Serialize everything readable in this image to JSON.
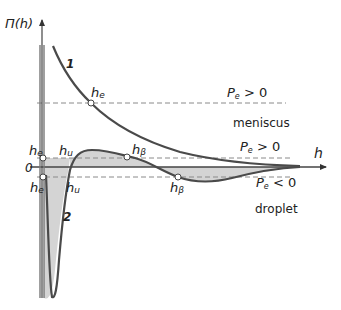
{
  "diagram": {
    "y_axis_label": "Π(h)",
    "x_axis_label": "h",
    "zero_label": "0",
    "curve_labels": {
      "curve1": "1",
      "curve2": "2"
    },
    "points": {
      "he_upper": "h",
      "he_upper_sub": "e",
      "he_wall_top": "h",
      "he_wall_top_sub": "e",
      "he_wall_bottom": "h",
      "he_wall_bottom_sub": "e",
      "hu_top": "h",
      "hu_top_sub": "u",
      "hu_bottom": "h",
      "hu_bottom_sub": "u",
      "hb_top": "h",
      "hb_top_sub": "β",
      "hb_bottom": "h",
      "hb_bottom_sub": "β"
    },
    "pressure_labels": {
      "top": {
        "P": "P",
        "sub": "e",
        "rel": " > 0"
      },
      "middle": {
        "P": "P",
        "sub": "e",
        "rel": " > 0"
      },
      "bottom": {
        "P": "P",
        "sub": "e",
        "rel": " < 0"
      }
    },
    "region_labels": {
      "meniscus": "meniscus",
      "droplet": "droplet"
    },
    "colors": {
      "curve": "#4a4a4a",
      "axis": "#555555",
      "dash": "#8a8a8a",
      "fill": "#cfcfcf",
      "text": "#222222"
    }
  }
}
